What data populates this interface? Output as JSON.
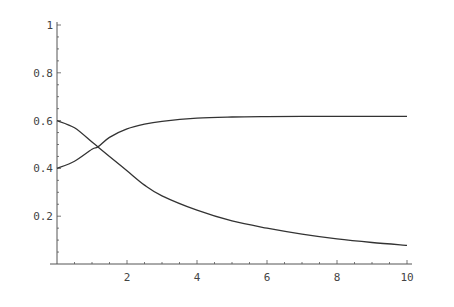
{
  "chart_data": {
    "type": "line",
    "title": "",
    "xlabel": "",
    "ylabel": "",
    "xlim": [
      0,
      10
    ],
    "ylim": [
      0,
      1
    ],
    "grid": false,
    "legend": null,
    "x_ticks": [
      2,
      4,
      6,
      8,
      10
    ],
    "y_ticks": [
      0.2,
      0.4,
      0.6,
      0.8,
      1
    ],
    "x_tick_labels": [
      "2",
      "4",
      "6",
      "8",
      "10"
    ],
    "y_tick_labels": [
      "0.2",
      "0.4",
      "0.6",
      "0.8",
      "1"
    ],
    "x": [
      0,
      0.5,
      1,
      1.17,
      1.5,
      2,
      2.5,
      3,
      4,
      5,
      6,
      7,
      8,
      9,
      10
    ],
    "series": [
      {
        "name": "rising curve",
        "values": [
          0.4,
          0.43,
          0.48,
          0.49,
          0.53,
          0.565,
          0.585,
          0.597,
          0.61,
          0.615,
          0.617,
          0.618,
          0.618,
          0.618,
          0.618
        ]
      },
      {
        "name": "falling curve",
        "values": [
          0.6,
          0.57,
          0.51,
          0.49,
          0.45,
          0.39,
          0.33,
          0.285,
          0.225,
          0.18,
          0.15,
          0.125,
          0.105,
          0.09,
          0.078
        ]
      }
    ],
    "annotations": [
      {
        "text": "curves cross near x≈1.2, y≈0.49"
      }
    ]
  },
  "colors": {
    "axis": "#555555",
    "line": "#333333",
    "background": "#ffffff"
  }
}
